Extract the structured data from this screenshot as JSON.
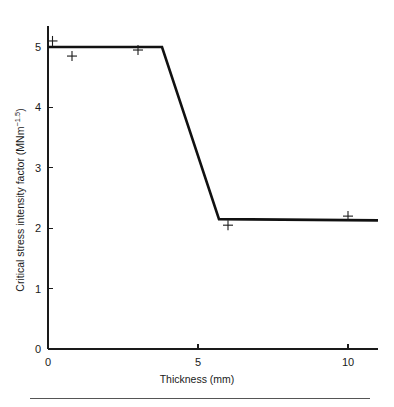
{
  "chart_data": {
    "type": "line",
    "title": "",
    "xlabel": "Thickness (mm)",
    "ylabel_text": "Critical stress intensity factor (MNm",
    "ylabel_superscript": "−1.5",
    "ylabel_close": ")",
    "ylabel_full": "Critical stress intensity factor (MNm−1.5)",
    "xlim": [
      0,
      11
    ],
    "ylim": [
      0,
      5.35
    ],
    "xticks": [
      0,
      5,
      10
    ],
    "xtick_labels": [
      "0",
      "5",
      "10"
    ],
    "yticks": [
      0,
      1,
      2,
      3,
      4,
      5
    ],
    "ytick_labels": [
      "0",
      "1",
      "2",
      "3",
      "4",
      "5"
    ],
    "grid": false,
    "legend": "none",
    "series": [
      {
        "name": "Critical stress intensity factor",
        "style": "solid-thick",
        "color": "#111111",
        "x": [
          0.0,
          3.8,
          5.7,
          11.0
        ],
        "y": [
          5.0,
          5.0,
          2.15,
          2.13
        ]
      }
    ],
    "markers": {
      "symbol": "+",
      "color": "#1a1a1a",
      "points": [
        {
          "x": 0.15,
          "y": 5.1
        },
        {
          "x": 0.8,
          "y": 4.85
        },
        {
          "x": 3.0,
          "y": 4.95
        },
        {
          "x": 6.0,
          "y": 2.05
        },
        {
          "x": 10.0,
          "y": 2.2
        }
      ]
    }
  },
  "figure": {
    "background": "#ffffff",
    "footer_rule": true
  }
}
